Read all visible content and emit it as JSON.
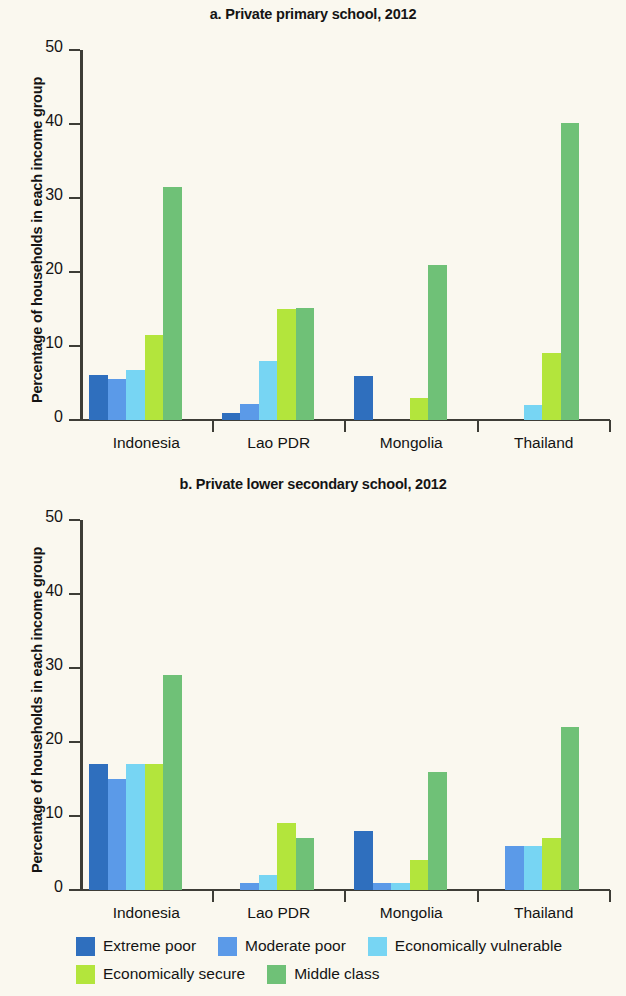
{
  "figure": {
    "background_color": "#faf8ef",
    "y_axis_label": "Percentage of households in each income group"
  },
  "legend": {
    "position": "bottom",
    "rows": [
      [
        {
          "label": "Extreme poor",
          "color": "#2f6fbe"
        },
        {
          "label": "Moderate poor",
          "color": "#5b9ae8"
        },
        {
          "label": "Economically vulnerable",
          "color": "#77d5f3"
        }
      ],
      [
        {
          "label": "Economically secure",
          "color": "#b3e53c"
        },
        {
          "label": "Middle class",
          "color": "#6fc177"
        }
      ]
    ]
  },
  "chart_data": [
    {
      "type": "bar",
      "panel": "a",
      "title": "a. Private primary school, 2012",
      "xlabel": "",
      "ylabel": "Percentage of households in each income group",
      "ylim": [
        0,
        50
      ],
      "yticks": [
        0,
        10,
        20,
        30,
        40,
        50
      ],
      "ytick_labels": [
        "0",
        "10",
        "20",
        "30",
        "40",
        "50"
      ],
      "grid": false,
      "legend_position": "bottom",
      "categories": [
        "Indonesia",
        "Lao PDR",
        "Mongolia",
        "Thailand"
      ],
      "series": [
        {
          "name": "Extreme poor",
          "color": "#2f6fbe",
          "values": [
            6.1,
            1.0,
            6.0,
            null
          ]
        },
        {
          "name": "Moderate poor",
          "color": "#5b9ae8",
          "values": [
            5.6,
            2.2,
            null,
            null
          ]
        },
        {
          "name": "Economically vulnerable",
          "color": "#77d5f3",
          "values": [
            6.7,
            8.0,
            null,
            2.0
          ]
        },
        {
          "name": "Economically secure",
          "color": "#b3e53c",
          "values": [
            11.5,
            15.0,
            3.0,
            9.0
          ]
        },
        {
          "name": "Middle class",
          "color": "#6fc177",
          "values": [
            31.5,
            15.2,
            21.0,
            40.2
          ]
        }
      ]
    },
    {
      "type": "bar",
      "panel": "b",
      "title": "b. Private lower secondary school, 2012",
      "xlabel": "",
      "ylabel": "Percentage of households in each income group",
      "ylim": [
        0,
        50
      ],
      "yticks": [
        0,
        10,
        20,
        30,
        40,
        50
      ],
      "ytick_labels": [
        "0",
        "10",
        "20",
        "30",
        "40",
        "50"
      ],
      "grid": false,
      "legend_position": "bottom",
      "categories": [
        "Indonesia",
        "Lao PDR",
        "Mongolia",
        "Thailand"
      ],
      "series": [
        {
          "name": "Extreme poor",
          "color": "#2f6fbe",
          "values": [
            17.0,
            null,
            8.0,
            null
          ]
        },
        {
          "name": "Moderate poor",
          "color": "#5b9ae8",
          "values": [
            15.0,
            1.0,
            1.0,
            6.0
          ]
        },
        {
          "name": "Economically vulnerable",
          "color": "#77d5f3",
          "values": [
            17.0,
            2.0,
            1.0,
            6.0
          ]
        },
        {
          "name": "Economically secure",
          "color": "#b3e53c",
          "values": [
            17.0,
            9.0,
            4.0,
            7.0
          ]
        },
        {
          "name": "Middle class",
          "color": "#6fc177",
          "values": [
            29.0,
            7.0,
            16.0,
            22.0
          ]
        }
      ]
    }
  ]
}
